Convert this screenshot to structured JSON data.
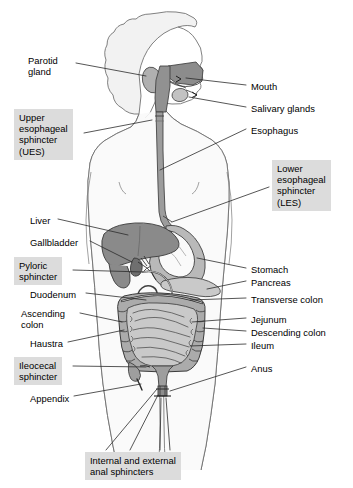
{
  "figure": {
    "type": "labeled-anatomical-diagram",
    "background_color": "#ffffff",
    "highlight_box_color": "#dcdcdc",
    "line_color": "#2b2b2b",
    "body_outline_color": "#555555"
  },
  "palette": {
    "body_fill": "#f7f7f7",
    "head_fill": "#f2f2f2",
    "oral_cavity": "#8c8c8c",
    "pharynx": "#8f8f8f",
    "parotid": "#b3b3b3",
    "salivary": "#c4c4c4",
    "esophagus": "#9a9a9a",
    "liver": "#888888",
    "gallbladder": "#777777",
    "stomach": "#b8b8b8",
    "pancreas": "#c8c8c8",
    "duodenum": "#d2d2d2",
    "small_intestine": "#c9c9c9",
    "large_intestine": "#a8a8a8",
    "rectum": "#9e9e9e",
    "anus": "#888888"
  },
  "labels": {
    "left": [
      {
        "id": "parotid-gland",
        "text": "Parotid\ngland",
        "boxed": false,
        "x": 28,
        "y": 55
      },
      {
        "id": "upper-esophageal-sphincter",
        "text": "Upper\nesophageal\nsphincter\n(UES)",
        "boxed": true,
        "x": 14,
        "y": 109
      },
      {
        "id": "liver",
        "text": "Liver",
        "boxed": false,
        "x": 30,
        "y": 215
      },
      {
        "id": "gallbladder",
        "text": "Gallbladder",
        "boxed": false,
        "x": 30,
        "y": 237
      },
      {
        "id": "pyloric-sphincter",
        "text": "Pyloric\nsphincter",
        "boxed": true,
        "x": 14,
        "y": 257
      },
      {
        "id": "duodenum",
        "text": "Duodenum",
        "boxed": false,
        "x": 30,
        "y": 289
      },
      {
        "id": "ascending-colon",
        "text": "Ascending\ncolon",
        "boxed": false,
        "x": 21,
        "y": 308
      },
      {
        "id": "haustra",
        "text": "Haustra",
        "boxed": false,
        "x": 30,
        "y": 338
      },
      {
        "id": "ileocecal-sphincter",
        "text": "Ileocecal\nsphincter",
        "boxed": true,
        "x": 14,
        "y": 357
      },
      {
        "id": "appendix",
        "text": "Appendix",
        "boxed": false,
        "x": 30,
        "y": 393
      }
    ],
    "right": [
      {
        "id": "mouth",
        "text": "Mouth",
        "boxed": false,
        "x": 251,
        "y": 81
      },
      {
        "id": "salivary-glands",
        "text": "Salivary glands",
        "boxed": false,
        "x": 251,
        "y": 103
      },
      {
        "id": "esophagus",
        "text": "Esophagus",
        "boxed": false,
        "x": 251,
        "y": 125
      },
      {
        "id": "lower-esophageal-sphincter",
        "text": "Lower\nesophageal\nsphincter\n(LES)",
        "boxed": true,
        "x": 272,
        "y": 160
      },
      {
        "id": "stomach",
        "text": "Stomach",
        "boxed": false,
        "x": 251,
        "y": 264
      },
      {
        "id": "pancreas",
        "text": "Pancreas",
        "boxed": false,
        "x": 251,
        "y": 277
      },
      {
        "id": "transverse-colon",
        "text": "Transverse colon",
        "boxed": false,
        "x": 251,
        "y": 294
      },
      {
        "id": "jejunum",
        "text": "Jejunum",
        "boxed": false,
        "x": 251,
        "y": 314
      },
      {
        "id": "descending-colon",
        "text": "Descending colon",
        "boxed": false,
        "x": 251,
        "y": 327
      },
      {
        "id": "ileum",
        "text": "Ileum",
        "boxed": false,
        "x": 251,
        "y": 340
      },
      {
        "id": "anus",
        "text": "Anus",
        "boxed": false,
        "x": 251,
        "y": 363
      }
    ],
    "bottom": [
      {
        "id": "anal-sphincters",
        "text": "Internal and external\nanal sphincters",
        "boxed": true,
        "x": 85,
        "y": 452
      }
    ]
  }
}
